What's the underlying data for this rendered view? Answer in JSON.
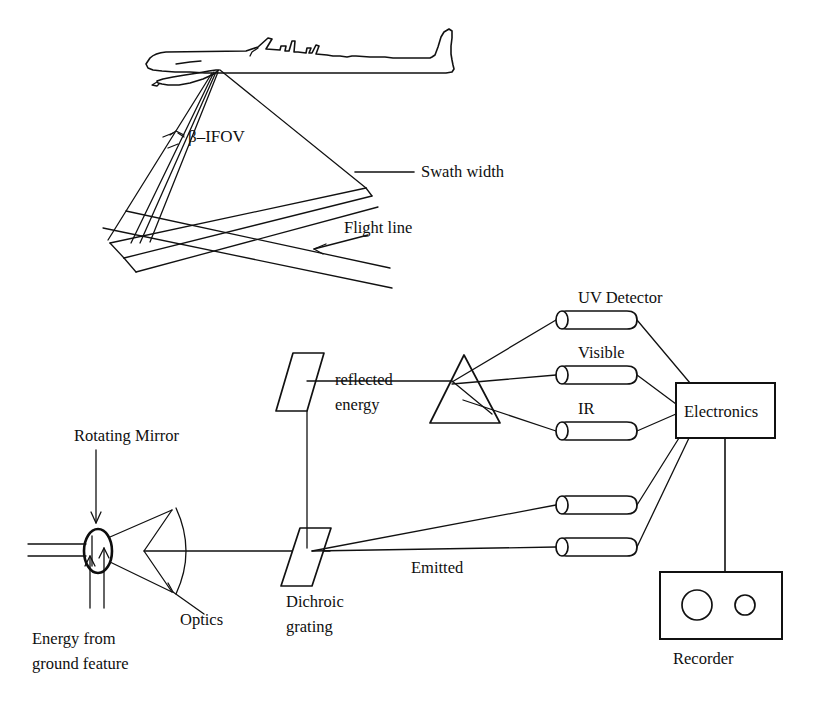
{
  "figure": {
    "kind": "line-diagram",
    "background_color": "#ffffff",
    "ink_color": "#111111"
  },
  "upper_scene": {
    "name": "airborne-scanning-geometry",
    "aircraft": "aircraft-silhouette",
    "labels": {
      "ifov": "β–IFOV",
      "swath_width": "Swath width",
      "flight_line": "Flight line"
    }
  },
  "lower_scene": {
    "name": "scanner-optical-train",
    "labels": {
      "rotating_mirror": "Rotating Mirror",
      "optics": "Optics",
      "energy_source_line1": "Energy from",
      "energy_source_line2": "ground feature",
      "dichroic_line1": "Dichroic",
      "dichroic_line2": "grating",
      "reflected_line1": "reflected",
      "reflected_line2": "energy",
      "emitted": "Emitted",
      "electronics": "Electronics",
      "recorder": "Recorder"
    },
    "detectors": [
      {
        "id": "uv",
        "label": "UV Detector",
        "labeled": true
      },
      {
        "id": "visible",
        "label": "Visible",
        "labeled": true
      },
      {
        "id": "ir",
        "label": "IR",
        "labeled": true
      },
      {
        "id": "thermal-a",
        "label": "",
        "labeled": false
      },
      {
        "id": "thermal-b",
        "label": "",
        "labeled": false
      }
    ]
  }
}
